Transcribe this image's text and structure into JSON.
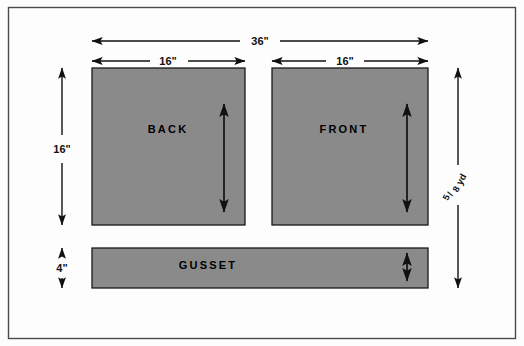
{
  "figure": {
    "frame": {
      "border_color": "#4a4a4a"
    },
    "colors": {
      "fabric_gray": "#8a8a8a",
      "outline": "#1a1a1a",
      "background": "#fdfdfd",
      "arrow": "#111111"
    }
  },
  "dimensions": {
    "total_width": "36\"",
    "back_width": "16\"",
    "front_width": "16\"",
    "panel_height": "16\"",
    "gusset_height": "4\"",
    "yardage_numerator": "5",
    "yardage_denominator": "8",
    "yardage_slash": "/",
    "yardage_unit": "yd"
  },
  "pieces": [
    {
      "name": "BACK",
      "label": "BACK"
    },
    {
      "name": "FRONT",
      "label": "FRONT"
    },
    {
      "name": "GUSSET",
      "label": "GUSSET"
    }
  ],
  "labels": {
    "back": "BACK",
    "front": "FRONT",
    "gusset": "GUSSET"
  }
}
